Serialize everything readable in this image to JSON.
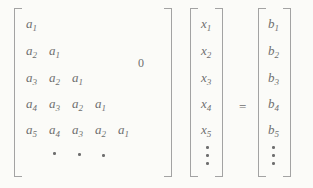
{
  "figure": {
    "background": "#fbfbf8",
    "ink": "#6f6f6f",
    "bracket_color": "#a3a3a3"
  },
  "equation": {
    "matrix": {
      "rows": [
        [
          {
            "base": "a",
            "sub": "1"
          }
        ],
        [
          {
            "base": "a",
            "sub": "2"
          },
          {
            "base": "a",
            "sub": "1"
          }
        ],
        [
          {
            "base": "a",
            "sub": "3"
          },
          {
            "base": "a",
            "sub": "2"
          },
          {
            "base": "a",
            "sub": "1"
          }
        ],
        [
          {
            "base": "a",
            "sub": "4"
          },
          {
            "base": "a",
            "sub": "3"
          },
          {
            "base": "a",
            "sub": "2"
          },
          {
            "base": "a",
            "sub": "1"
          }
        ],
        [
          {
            "base": "a",
            "sub": "5"
          },
          {
            "base": "a",
            "sub": "4"
          },
          {
            "base": "a",
            "sub": "3"
          },
          {
            "base": "a",
            "sub": "2"
          },
          {
            "base": "a",
            "sub": "1"
          }
        ]
      ],
      "zero_label": "0",
      "diagonal_ellipsis_dots": 3
    },
    "x_vector": {
      "entries": [
        {
          "base": "x",
          "sub": "1"
        },
        {
          "base": "x",
          "sub": "2"
        },
        {
          "base": "x",
          "sub": "3"
        },
        {
          "base": "x",
          "sub": "4"
        },
        {
          "base": "x",
          "sub": "5"
        }
      ],
      "vertical_ellipsis_dots": 3
    },
    "equals_sign": "=",
    "b_vector": {
      "entries": [
        {
          "base": "b",
          "sub": "1"
        },
        {
          "base": "b",
          "sub": "2"
        },
        {
          "base": "b",
          "sub": "3"
        },
        {
          "base": "b",
          "sub": "4"
        },
        {
          "base": "b",
          "sub": "5"
        }
      ],
      "vertical_ellipsis_dots": 3
    }
  }
}
